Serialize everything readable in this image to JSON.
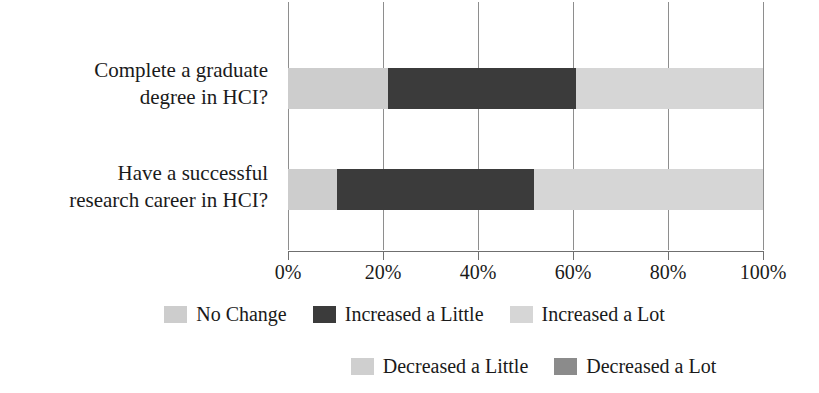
{
  "chart_data": {
    "type": "bar",
    "orientation": "horizontal",
    "stacked": true,
    "stacked_100": true,
    "title": "",
    "subtitle": "",
    "xlabel": "",
    "ylabel": "",
    "categories": [
      "Complete a graduate degree in HCI?",
      "Have a successful research career in HCI?"
    ],
    "category_lines": [
      [
        "Complete a graduate",
        "degree in HCI?"
      ],
      [
        "Have a successful",
        "research career in HCI?"
      ]
    ],
    "xlim": [
      0,
      100
    ],
    "xticks": [
      0,
      20,
      40,
      60,
      80,
      100
    ],
    "xtick_labels": [
      "0%",
      "20%",
      "40%",
      "60%",
      "80%",
      "100%"
    ],
    "grid": true,
    "grid_axis": "x",
    "legend_position": "bottom",
    "series": [
      {
        "name": "No Change",
        "color": "#cdcdcd",
        "values": [
          21,
          10
        ]
      },
      {
        "name": "Increased a Little",
        "color": "#3b3b3b",
        "values": [
          40,
          42
        ]
      },
      {
        "name": "Increased a Lot",
        "color": "#d6d6d6",
        "values": [
          39,
          48
        ]
      },
      {
        "name": "Decreased a Little",
        "color": "#cfcfcf",
        "values": [
          0,
          0
        ]
      },
      {
        "name": "Decreased a Lot",
        "color": "#8b8b8b",
        "values": [
          0,
          0
        ]
      }
    ],
    "bars": [
      {
        "category": "Complete a graduate degree in HCI?",
        "segments": [
          {
            "label": "No Change",
            "start": 0,
            "end": 21,
            "value": 21,
            "color": "#cdcdcd"
          },
          {
            "label": "Increased a Little",
            "start": 21,
            "end": 60.6,
            "value": 39.6,
            "color": "#3b3b3b"
          },
          {
            "label": "Increased a Lot",
            "start": 60.6,
            "end": 100,
            "value": 39.4,
            "color": "#d6d6d6"
          }
        ]
      },
      {
        "category": "Have a successful research career in HCI?",
        "segments": [
          {
            "label": "No Change",
            "start": 0,
            "end": 10.3,
            "value": 10.3,
            "color": "#cdcdcd"
          },
          {
            "label": "Increased a Little",
            "start": 10.3,
            "end": 51.8,
            "value": 41.5,
            "color": "#3b3b3b"
          },
          {
            "label": "Increased a Lot",
            "start": 51.8,
            "end": 100,
            "value": 48.2,
            "color": "#d6d6d6"
          }
        ]
      }
    ]
  },
  "legend": {
    "rows": [
      [
        {
          "label": "No Change",
          "color": "#cdcdcd"
        },
        {
          "label": "Increased a Little",
          "color": "#3b3b3b"
        },
        {
          "label": "Increased a Lot",
          "color": "#d6d6d6"
        }
      ],
      [
        {
          "label": "Decreased a Little",
          "color": "#cfcfcf"
        },
        {
          "label": "Decreased a Lot",
          "color": "#8b8b8b"
        }
      ]
    ]
  },
  "axis": {
    "tick_labels": [
      "0%",
      "20%",
      "40%",
      "60%",
      "80%",
      "100%"
    ],
    "tick_values": [
      0,
      20,
      40,
      60,
      80,
      100
    ]
  },
  "colors": {
    "gridline": "#8e8e8e",
    "axis": "#6f6f6f",
    "text": "#1a1a1a",
    "background": "#ffffff"
  }
}
